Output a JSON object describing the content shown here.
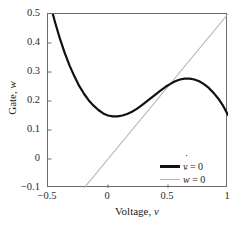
{
  "axes": {
    "xlabel_prefix": "Voltage, ",
    "xlabel_var": "v",
    "ylabel_prefix": "Gate, ",
    "ylabel_var": "w",
    "xticks": [
      "−0.5",
      "0",
      "0.5",
      "1"
    ],
    "xtick_values": [
      -0.5,
      0,
      0.5,
      1
    ],
    "yticks": [
      "0.5",
      "0.4",
      "0.3",
      "0.2",
      "0.1",
      "0",
      "−0.1"
    ],
    "ytick_values": [
      0.5,
      0.4,
      0.3,
      0.2,
      0.1,
      0,
      -0.1
    ]
  },
  "legend": {
    "items": [
      {
        "name": "v-nullcline",
        "var": "v",
        "equals": " = 0",
        "color": "#111111",
        "width": 2.2
      },
      {
        "name": "w-nullcline",
        "var": "w",
        "equals": " = 0",
        "color": "#b4b4b4",
        "width": 1.1
      }
    ]
  },
  "chart_data": {
    "type": "line",
    "title": "",
    "xlabel": "Voltage, v",
    "ylabel": "Gate, w",
    "xlim": [
      -0.5,
      1.0
    ],
    "ylim": [
      -0.1,
      0.5
    ],
    "xticks": [
      -0.5,
      0,
      0.5,
      1
    ],
    "yticks": [
      -0.1,
      0,
      0.1,
      0.2,
      0.3,
      0.4,
      0.5
    ],
    "grid": false,
    "legend_position": "lower right",
    "series": [
      {
        "name": "v̇ = 0",
        "label": "v-dot = 0 (cubic nullcline)",
        "color": "#111111",
        "linewidth": 2.2,
        "x": [
          -0.46,
          -0.44,
          -0.4,
          -0.36,
          -0.32,
          -0.28,
          -0.24,
          -0.2,
          -0.16,
          -0.12,
          -0.08,
          -0.04,
          0.0,
          0.04,
          0.08,
          0.12,
          0.16,
          0.2,
          0.24,
          0.28,
          0.32,
          0.36,
          0.4,
          0.44,
          0.48,
          0.52,
          0.56,
          0.6,
          0.64,
          0.68,
          0.72,
          0.76,
          0.8,
          0.84,
          0.88,
          0.92,
          0.96,
          1.0
        ],
        "y": [
          0.5,
          0.47,
          0.414,
          0.365,
          0.322,
          0.285,
          0.252,
          0.225,
          0.202,
          0.184,
          0.169,
          0.157,
          0.15,
          0.147,
          0.147,
          0.15,
          0.155,
          0.163,
          0.173,
          0.185,
          0.198,
          0.211,
          0.224,
          0.237,
          0.249,
          0.259,
          0.268,
          0.274,
          0.277,
          0.277,
          0.274,
          0.268,
          0.258,
          0.245,
          0.228,
          0.208,
          0.183,
          0.152
        ]
      },
      {
        "name": "ẇ = 0",
        "label": "w-dot = 0 (linear nullcline, w = 0.5v)",
        "color": "#b4b4b4",
        "linewidth": 1.1,
        "x": [
          -0.2,
          1.0
        ],
        "y": [
          -0.1,
          0.5
        ]
      }
    ],
    "annotations": [
      {
        "kind": "intersection",
        "x": 0.5,
        "y": 0.25,
        "note": "nullclines cross"
      }
    ]
  }
}
